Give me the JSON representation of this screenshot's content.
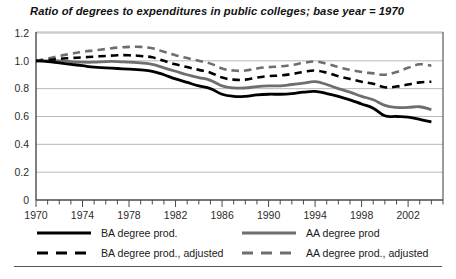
{
  "chart_data": {
    "type": "line",
    "title": "Ratio of degrees to expenditures in public colleges; base year = 1970",
    "xlabel": "",
    "ylabel": "",
    "xlim": [
      1970,
      2005
    ],
    "ylim": [
      0,
      1.2
    ],
    "ytick_labels": [
      "0",
      "0.2",
      "0.4",
      "0.6",
      "0.8",
      "1.0",
      "1.2"
    ],
    "ytick_values": [
      0,
      0.2,
      0.4,
      0.6,
      0.8,
      1.0,
      1.2
    ],
    "xtick_labels": [
      "1970",
      "1974",
      "1978",
      "1982",
      "1986",
      "1990",
      "1994",
      "1998",
      "2002"
    ],
    "xtick_values": [
      1970,
      1974,
      1978,
      1982,
      1986,
      1990,
      1994,
      1998,
      2002
    ],
    "minor_xticks_every": 1,
    "grid": "horizontal",
    "legend_position": "below",
    "x": [
      1970,
      1971,
      1972,
      1973,
      1974,
      1975,
      1976,
      1977,
      1978,
      1979,
      1980,
      1981,
      1982,
      1983,
      1984,
      1985,
      1986,
      1987,
      1988,
      1989,
      1990,
      1991,
      1992,
      1993,
      1994,
      1995,
      1996,
      1997,
      1998,
      1999,
      2000,
      2001,
      2002,
      2003,
      2004
    ],
    "series": [
      {
        "name": "BA degree prod.",
        "color": "#000000",
        "style": "solid",
        "values": [
          1.0,
          0.995,
          0.985,
          0.975,
          0.965,
          0.955,
          0.95,
          0.945,
          0.94,
          0.935,
          0.925,
          0.9,
          0.87,
          0.845,
          0.82,
          0.8,
          0.76,
          0.745,
          0.745,
          0.755,
          0.76,
          0.76,
          0.765,
          0.775,
          0.78,
          0.765,
          0.745,
          0.72,
          0.69,
          0.66,
          0.605,
          0.6,
          0.595,
          0.58,
          0.56
        ]
      },
      {
        "name": "AA degree prod",
        "color": "#6e6e6e",
        "style": "solid",
        "values": [
          1.0,
          1.0,
          1.0,
          0.995,
          0.99,
          0.99,
          0.995,
          0.995,
          0.99,
          0.985,
          0.975,
          0.95,
          0.925,
          0.9,
          0.88,
          0.86,
          0.82,
          0.805,
          0.805,
          0.815,
          0.82,
          0.82,
          0.83,
          0.84,
          0.85,
          0.83,
          0.8,
          0.775,
          0.745,
          0.72,
          0.68,
          0.665,
          0.665,
          0.67,
          0.65
        ]
      },
      {
        "name": "BA degree prod., adjusted",
        "color": "#000000",
        "style": "dashed",
        "values": [
          1.0,
          1.005,
          1.015,
          1.02,
          1.025,
          1.03,
          1.035,
          1.04,
          1.04,
          1.035,
          1.025,
          1.0,
          0.975,
          0.955,
          0.935,
          0.915,
          0.88,
          0.865,
          0.865,
          0.88,
          0.89,
          0.895,
          0.905,
          0.92,
          0.93,
          0.915,
          0.89,
          0.87,
          0.85,
          0.835,
          0.81,
          0.815,
          0.83,
          0.845,
          0.85
        ]
      },
      {
        "name": "AA degree prod., adjusted",
        "color": "#6e6e6e",
        "style": "dashed",
        "values": [
          1.0,
          1.015,
          1.035,
          1.05,
          1.065,
          1.075,
          1.085,
          1.095,
          1.1,
          1.1,
          1.09,
          1.065,
          1.04,
          1.02,
          1.0,
          0.98,
          0.945,
          0.93,
          0.93,
          0.945,
          0.955,
          0.96,
          0.97,
          0.985,
          0.995,
          0.98,
          0.955,
          0.935,
          0.92,
          0.91,
          0.9,
          0.92,
          0.95,
          0.975,
          0.965
        ]
      }
    ]
  },
  "legend": {
    "entries": [
      {
        "label": "BA degree prod.",
        "color": "#000000",
        "style": "solid"
      },
      {
        "label": "AA degree prod",
        "color": "#6e6e6e",
        "style": "solid"
      },
      {
        "label": "BA degree prod., adjusted",
        "color": "#000000",
        "style": "dashed"
      },
      {
        "label": "AA degree prod., adjusted",
        "color": "#6e6e6e",
        "style": "dashed"
      }
    ]
  },
  "colors": {
    "ba": "#000000",
    "aa": "#6e6e6e",
    "axis": "#4a4a4a",
    "grid": "#b8b8b8",
    "background": "#ffffff"
  }
}
